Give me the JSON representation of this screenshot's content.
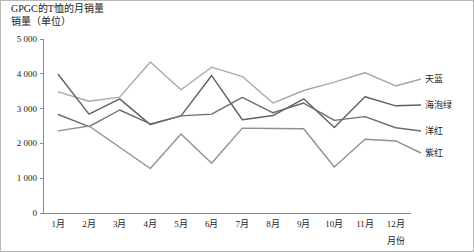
{
  "chart_data": {
    "type": "line",
    "title": "GPGC的T恤的月销量",
    "subtitle": "销量（单位）",
    "xlabel": "月份",
    "ylabel": "销量（单位）",
    "categories": [
      "1月",
      "2月",
      "3月",
      "4月",
      "5月",
      "6月",
      "7月",
      "8月",
      "9月",
      "10月",
      "11月",
      "12月"
    ],
    "ylim": [
      0,
      5000
    ],
    "ytick_labels": [
      "0",
      "1 000",
      "2 000",
      "3 000",
      "4 000",
      "5 000"
    ],
    "ytick_values": [
      0,
      1000,
      2000,
      3000,
      4000,
      5000
    ],
    "grid": false,
    "legend_position": "right",
    "series": [
      {
        "name": "天蓝",
        "color": "#a9a9a9",
        "values": [
          3480,
          3210,
          3330,
          4340,
          3540,
          4190,
          3920,
          3160,
          3520,
          3760,
          4030,
          3650
        ]
      },
      {
        "name": "海泡绿",
        "color": "#606060",
        "values": [
          3980,
          2840,
          3280,
          2540,
          2790,
          3950,
          2680,
          2800,
          3280,
          2460,
          3340,
          3080
        ]
      },
      {
        "name": "洋红",
        "color": "#6e6e6e",
        "values": [
          2830,
          2480,
          2960,
          2560,
          2790,
          2840,
          3320,
          2880,
          3160,
          2660,
          2770,
          2450
        ]
      },
      {
        "name": "紫红",
        "color": "#919191",
        "values": [
          2360,
          2500,
          1890,
          1280,
          2270,
          1430,
          2440,
          2430,
          2420,
          1320,
          2120,
          2070
        ]
      }
    ]
  },
  "axes": {
    "y_axis_name": "y-axis",
    "x_axis_name": "x-axis"
  }
}
